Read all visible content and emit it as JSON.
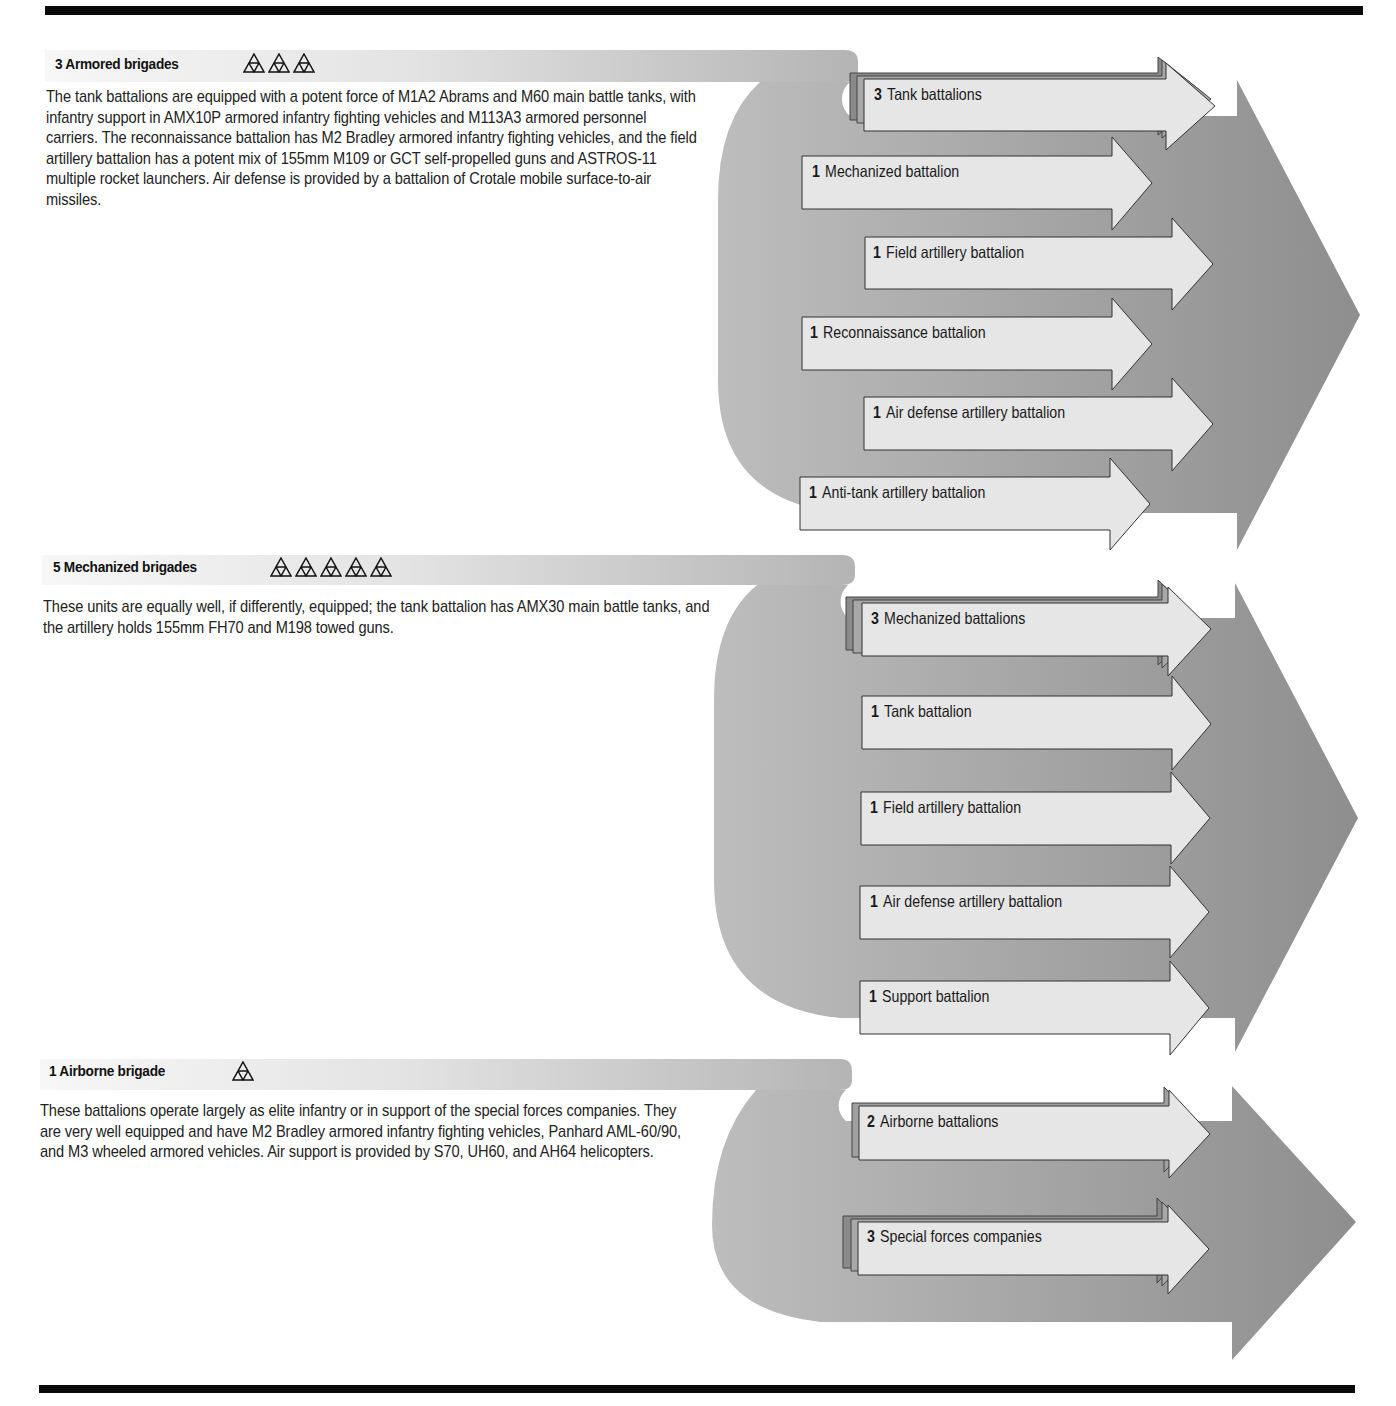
{
  "colors": {
    "band_light": "#f2f2f2",
    "band_dark": "#b5b5b5",
    "big_arrow_light": "#b8b8b8",
    "big_arrow_dark": "#8f8f8f",
    "small_arrow_fill": "#e6e6e6",
    "small_arrow_stack_1": "#8a8a8a",
    "small_arrow_stack_2": "#a6a6a6",
    "rule": "#0a0a0a"
  },
  "sections": [
    {
      "id": "armored",
      "count": "3",
      "title": "Armored brigades",
      "symbol_count": 3,
      "description": "The tank battalions are equipped with a potent force of M1A2 Abrams and M60 main battle tanks, with infantry support in AMX10P armored infantry fighting vehicles and M113A3 armored personnel carriers. The reconnaissance battalion has M2 Bradley armored infantry fighting vehicles, and the field artillery battalion has a potent mix of 155mm M109 or GCT self-propelled guns and ASTROS-11 multiple rocket launchers. Air defense is provided by a battalion of Crotale mobile surface-to-air missiles.",
      "units": [
        {
          "count": "3",
          "label": "Tank battalions",
          "stacked": 3
        },
        {
          "count": "1",
          "label": "Mechanized battalion",
          "stacked": 1
        },
        {
          "count": "1",
          "label": "Field artillery battalion",
          "stacked": 1
        },
        {
          "count": "1",
          "label": "Reconnaissance battalion",
          "stacked": 1
        },
        {
          "count": "1",
          "label": "Air defense artillery battalion",
          "stacked": 1
        },
        {
          "count": "1",
          "label": "Anti-tank artillery battalion",
          "stacked": 1
        }
      ]
    },
    {
      "id": "mechanized",
      "count": "5",
      "title": "Mechanized brigades",
      "symbol_count": 5,
      "description": "These units are equally well, if differently, equipped; the tank battalion has AMX30 main battle tanks, and the artillery holds 155mm FH70 and M198 towed guns.",
      "units": [
        {
          "count": "3",
          "label": "Mechanized battalions",
          "stacked": 3
        },
        {
          "count": "1",
          "label": "Tank battalion",
          "stacked": 1
        },
        {
          "count": "1",
          "label": "Field artillery battalion",
          "stacked": 1
        },
        {
          "count": "1",
          "label": "Air defense artillery battalion",
          "stacked": 1
        },
        {
          "count": "1",
          "label": "Support battalion",
          "stacked": 1
        }
      ]
    },
    {
      "id": "airborne",
      "count": "1",
      "title": "Airborne brigade",
      "symbol_count": 1,
      "description": "These battalions operate largely as elite infantry or in support of the special forces companies. They are very well equipped and have M2 Bradley armored infantry fighting vehicles, Panhard AML-60/90, and M3 wheeled armored vehicles. Air support is provided by S70, UH60, and AH64 helicopters.",
      "units": [
        {
          "count": "2",
          "label": "Airborne battalions",
          "stacked": 2
        },
        {
          "count": "3",
          "label": "Special forces companies",
          "stacked": 3
        }
      ]
    }
  ]
}
